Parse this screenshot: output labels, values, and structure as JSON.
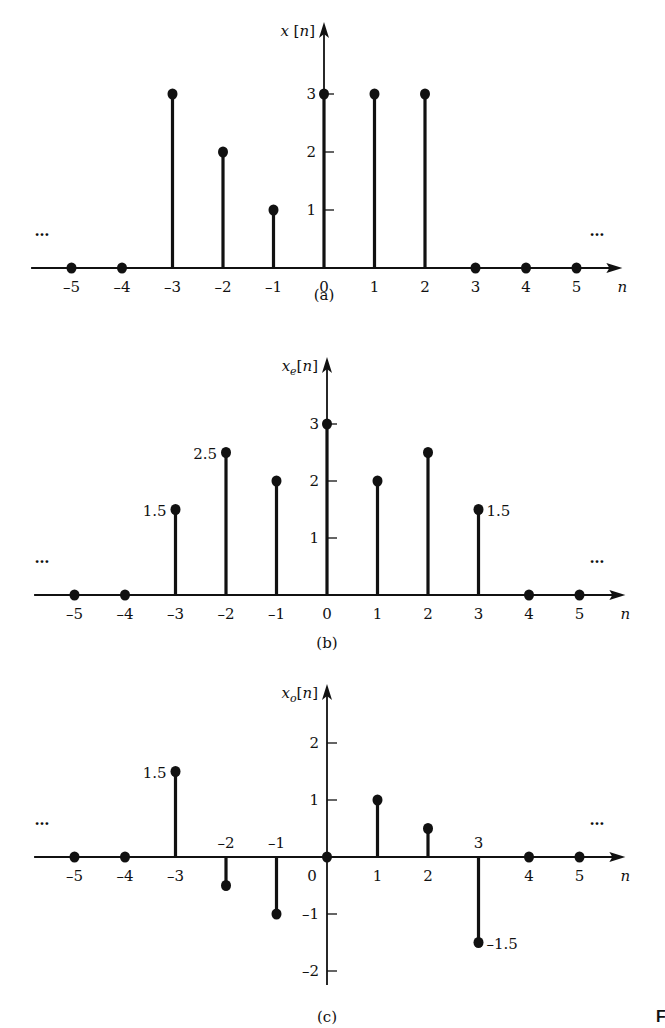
{
  "chart_data": [
    {
      "type": "stem",
      "panel": "(a)",
      "ylabel": "x[n]",
      "xlabel": "n",
      "x": [
        -5,
        -4,
        -3,
        -2,
        -1,
        0,
        1,
        2,
        3,
        4,
        5
      ],
      "values": [
        0,
        0,
        3,
        2,
        1,
        3,
        3,
        3,
        0,
        0,
        0
      ],
      "yticks": [
        1,
        2,
        3
      ],
      "xticks": [
        "-5",
        "-4",
        "-3",
        "-2",
        "-1",
        "0",
        "1",
        "2",
        "3",
        "4",
        "5"
      ],
      "annotations": [
        "...",
        "..."
      ],
      "caption": "(a)"
    },
    {
      "type": "stem",
      "panel": "(b)",
      "ylabel": "x_e[n]",
      "xlabel": "n",
      "x": [
        -5,
        -4,
        -3,
        -2,
        -1,
        0,
        1,
        2,
        3,
        4,
        5
      ],
      "values": [
        0,
        0,
        1.5,
        2.5,
        2,
        3,
        2,
        2.5,
        1.5,
        0,
        0
      ],
      "yticks": [
        1,
        2,
        3
      ],
      "xticks": [
        "-5",
        "-4",
        "-3",
        "-2",
        "-1",
        "0",
        "1",
        "2",
        "3",
        "4",
        "5"
      ],
      "point_labels": [
        {
          "x": -3,
          "text": "1.5"
        },
        {
          "x": -2,
          "text": "2.5"
        },
        {
          "x": 3,
          "text": "1.5"
        }
      ],
      "annotations": [
        "...",
        "..."
      ],
      "caption": "(b)"
    },
    {
      "type": "stem",
      "panel": "(c)",
      "ylabel": "x_o[n]",
      "xlabel": "n",
      "x": [
        -5,
        -4,
        -3,
        -2,
        -1,
        0,
        1,
        2,
        3,
        4,
        5
      ],
      "values": [
        0,
        0,
        1.5,
        -0.5,
        -1,
        0,
        1,
        0.5,
        -1.5,
        0,
        0
      ],
      "yticks": [
        -2,
        -1,
        1,
        2
      ],
      "xticks": [
        "-5",
        "-4",
        "-3",
        "-2",
        "-1",
        "0",
        "1",
        "2",
        "3",
        "4",
        "5"
      ],
      "point_labels": [
        {
          "x": -3,
          "text": "1.5"
        },
        {
          "x": 3,
          "text": "-1.5"
        }
      ],
      "annotations": [
        "...",
        "..."
      ],
      "caption": "(c)"
    }
  ],
  "labels": {
    "a": {
      "ylabel_main": "x",
      "ylabel_arg": "[n]",
      "caption": "(a)"
    },
    "b": {
      "ylabel_main": "x",
      "ylabel_sub": "e",
      "ylabel_arg": "[n]",
      "caption": "(b)"
    },
    "c": {
      "ylabel_main": "x",
      "ylabel_sub": "o",
      "ylabel_arg": "[n]",
      "caption": "(c)"
    },
    "n": "n",
    "dots": "…",
    "fig_fragment": "F"
  }
}
